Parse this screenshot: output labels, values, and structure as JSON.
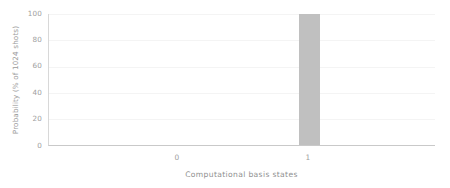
{
  "chart_data": {
    "type": "bar",
    "title": "",
    "xlabel": "Computational basis states",
    "ylabel": "Probability (% of 1024 shots)",
    "categories": [
      "0",
      "1"
    ],
    "values": [
      0,
      100
    ],
    "ylim": [
      0,
      100
    ],
    "yticks": [
      "0",
      "20",
      "40",
      "60",
      "80",
      "100"
    ],
    "ytick_values": [
      0,
      20,
      40,
      60,
      80,
      100
    ],
    "grid": true,
    "legend": false,
    "bar_color": "#c0c0c0",
    "axis_color": "#c9c9c9",
    "grid_color": "#f4f4f4",
    "text_color": "#9e9e9e",
    "background": "#ffffff"
  }
}
